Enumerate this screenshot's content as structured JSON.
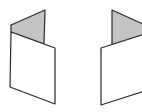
{
  "diagram": {
    "colors": {
      "background": "#ffffff",
      "fold_fill": "#c4c4c4",
      "panel_fill": "#ffffff",
      "stroke": "#2a2a2a"
    },
    "figures": [
      {
        "id": "left-folded-panel",
        "fold_side": "left"
      },
      {
        "id": "right-folded-panel",
        "fold_side": "right"
      }
    ]
  }
}
